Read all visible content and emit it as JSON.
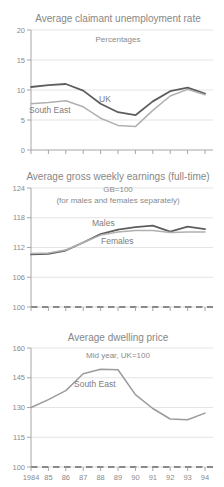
{
  "colors": {
    "background": "#ffffff",
    "title_text": "#878787",
    "axis_text": "#8a8a8a",
    "gridline": "#e4e4e4",
    "axis_line": "#a6a6a6",
    "baseline_dash": "#686868",
    "dark_series": "#5e5e5e",
    "light_series": "#b0b0b0"
  },
  "chart_data": [
    {
      "type": "line",
      "title": "Average claimant unemployment rate",
      "subtitles": [
        "Percentages"
      ],
      "x": [
        1984,
        1985,
        1986,
        1987,
        1988,
        1989,
        1990,
        1991,
        1992,
        1993,
        1994
      ],
      "x_tick_labels": [
        "1984",
        "85",
        "86",
        "87",
        "88",
        "89",
        "90",
        "91",
        "92",
        "93",
        "94"
      ],
      "show_x_tick_labels": false,
      "ylim": [
        0,
        20
      ],
      "yticks": [
        0,
        5,
        10,
        15,
        20
      ],
      "grid": true,
      "baseline_dashed": false,
      "legend_position": "inline-labels",
      "series": [
        {
          "name": "UK",
          "color": "#5e5e5e",
          "line_width": 1.8,
          "values": [
            10.5,
            10.8,
            11.0,
            9.9,
            7.7,
            6.3,
            5.8,
            8.1,
            9.8,
            10.4,
            9.4
          ]
        },
        {
          "name": "South East",
          "color": "#b0b0b0",
          "line_width": 1.5,
          "values": [
            7.7,
            7.9,
            8.2,
            7.2,
            5.3,
            4.1,
            3.9,
            6.6,
            9.0,
            10.1,
            9.2
          ]
        }
      ]
    },
    {
      "type": "line",
      "title": "Average gross weekly earnings (full-time)",
      "subtitles": [
        "GB=100",
        "(for males and females separately)"
      ],
      "x": [
        1984,
        1985,
        1986,
        1987,
        1988,
        1989,
        1990,
        1991,
        1992,
        1993,
        1994
      ],
      "x_tick_labels": [
        "1984",
        "85",
        "86",
        "87",
        "88",
        "89",
        "90",
        "91",
        "92",
        "93",
        "94"
      ],
      "show_x_tick_labels": false,
      "ylim": [
        100,
        124
      ],
      "yticks": [
        100,
        106,
        112,
        118,
        124
      ],
      "grid": true,
      "baseline_dashed": true,
      "legend_position": "inline-labels",
      "series": [
        {
          "name": "Males",
          "color": "#5e5e5e",
          "line_width": 1.8,
          "values": [
            110.6,
            110.7,
            111.4,
            113.0,
            114.7,
            115.6,
            116.1,
            116.4,
            115.2,
            116.2,
            115.7
          ]
        },
        {
          "name": "Females",
          "color": "#b0b0b0",
          "line_width": 1.5,
          "values": [
            110.8,
            110.9,
            111.5,
            113.0,
            114.5,
            115.1,
            115.4,
            115.4,
            115.0,
            115.1,
            115.1
          ]
        }
      ]
    },
    {
      "type": "line",
      "title": "Average dwelling price",
      "subtitles": [
        "Mid year, UK=100"
      ],
      "x": [
        1984,
        1985,
        1986,
        1987,
        1988,
        1989,
        1990,
        1991,
        1992,
        1993,
        1994
      ],
      "x_tick_labels": [
        "1984",
        "85",
        "86",
        "87",
        "88",
        "89",
        "90",
        "91",
        "92",
        "93",
        "94"
      ],
      "show_x_tick_labels": true,
      "ylim": [
        100,
        160
      ],
      "yticks": [
        100,
        115,
        130,
        145,
        160
      ],
      "grid": true,
      "baseline_dashed": true,
      "legend_position": "inline-labels",
      "series": [
        {
          "name": "South East",
          "color": "#9b9b9b",
          "line_width": 1.5,
          "values": [
            130,
            134,
            138.5,
            147,
            149.3,
            149,
            136.5,
            129.5,
            124.2,
            123.8,
            127.2
          ]
        }
      ]
    }
  ]
}
